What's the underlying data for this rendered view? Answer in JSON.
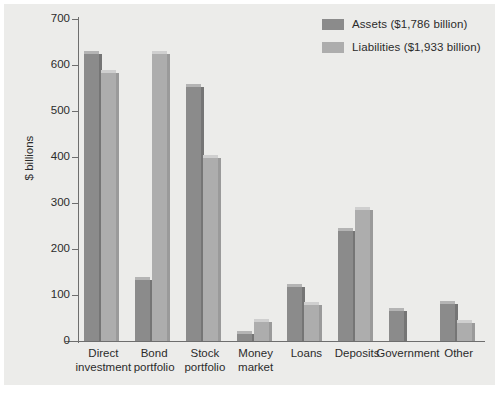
{
  "chart_data": {
    "type": "bar",
    "title": "",
    "xlabel": "",
    "ylabel": "$ billions",
    "ylim": [
      0,
      700
    ],
    "yticks": [
      0,
      100,
      200,
      300,
      400,
      500,
      600,
      700
    ],
    "grid": false,
    "legend_position": "top-right",
    "categories": [
      "Direct investment",
      "Bond portfolio",
      "Stock portfolio",
      "Money market",
      "Loans",
      "Deposits",
      "Government",
      "Other"
    ],
    "category_lines": [
      [
        "Direct",
        "investment"
      ],
      [
        "Bond",
        "portfolio"
      ],
      [
        "Stock",
        "portfolio"
      ],
      [
        "Money",
        "market"
      ],
      [
        "Loans",
        ""
      ],
      [
        "Deposits",
        ""
      ],
      [
        "Government",
        ""
      ],
      [
        "Other",
        ""
      ]
    ],
    "series": [
      {
        "name": "Assets ($1,786 billion)",
        "color": "#8b8b8b",
        "values": [
          625,
          133,
          553,
          15,
          118,
          240,
          65,
          80
        ]
      },
      {
        "name": "Liabilities ($1,933 billion)",
        "color": "#adadad",
        "values": [
          583,
          623,
          398,
          42,
          78,
          285,
          0,
          40
        ]
      }
    ]
  },
  "legend": {
    "items": [
      {
        "label": "Assets ($1,786 billion)",
        "color": "#8b8b8b"
      },
      {
        "label": "Liabilities ($1,933 billion)",
        "color": "#adadad"
      }
    ]
  },
  "axes": {
    "y_label": "$ billions",
    "y_ticks": [
      "700",
      "600",
      "500",
      "400",
      "300",
      "200",
      "100",
      "0"
    ]
  }
}
